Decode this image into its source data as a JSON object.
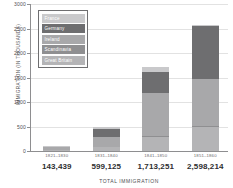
{
  "chart_data": {
    "type": "bar",
    "stacked": true,
    "title": "",
    "xlabel": "TOTAL IMMIGRATION",
    "ylabel": "IMMIGRATION (IN THOUSANDS)",
    "ylim": [
      0,
      3000
    ],
    "yticks": [
      0,
      500,
      1000,
      1500,
      2000,
      2500,
      3000
    ],
    "grid": true,
    "legend_position": "inside-top-left",
    "categories": [
      "1821–1830",
      "1831–1840",
      "1841–1850",
      "1851–1860"
    ],
    "category_totals": [
      "143,439",
      "599,125",
      "1,713,251",
      "2,598,214"
    ],
    "series": [
      {
        "name": "Great Britain",
        "color": "#b4b4b6",
        "values": [
          25,
          75,
          290,
          480
        ]
      },
      {
        "name": "Scandinavia",
        "color": "#8f8f91",
        "values": [
          2,
          5,
          15,
          25
        ]
      },
      {
        "name": "Ireland",
        "color": "#a8a8aa",
        "values": [
          55,
          210,
          870,
          965
        ]
      },
      {
        "name": "Germany",
        "color": "#6e6e70",
        "values": [
          8,
          155,
          435,
          1075
        ]
      },
      {
        "name": "France",
        "color": "#c9c9cb",
        "values": [
          10,
          50,
          95,
          35
        ]
      }
    ]
  },
  "legend": {
    "items": [
      {
        "label": "France",
        "swatch": "#c9c9cb"
      },
      {
        "label": "Germany",
        "swatch": "#6e6e70"
      },
      {
        "label": "Ireland",
        "swatch": "#a8a8aa"
      },
      {
        "label": "Scandinavia",
        "swatch": "#8f8f91"
      },
      {
        "label": "Great Britain",
        "swatch": "#b4b4b6"
      }
    ]
  },
  "axes": {
    "y_title": "IMMIGRATION (IN THOUSANDS)",
    "x_title": "TOTAL IMMIGRATION",
    "y_tick_labels": [
      "3000",
      "2500",
      "2000",
      "1500",
      "1000",
      "500",
      "0"
    ]
  }
}
